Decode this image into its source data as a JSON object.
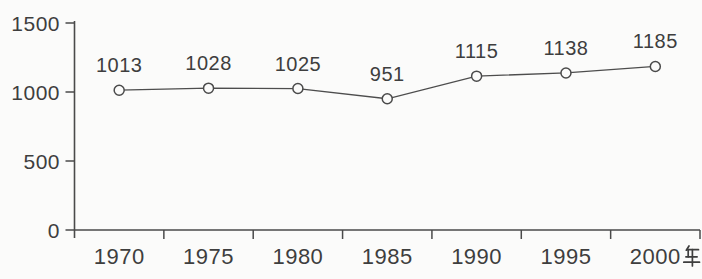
{
  "chart_data": {
    "type": "line",
    "title": "",
    "xlabel": "",
    "ylabel": "",
    "categories": [
      "1970",
      "1975",
      "1980",
      "1985",
      "1990",
      "1995",
      "2000"
    ],
    "values": [
      1013,
      1028,
      1025,
      951,
      1115,
      1138,
      1185
    ],
    "point_labels": [
      "1013",
      "1028",
      "1025",
      "951",
      "1115",
      "1138",
      "1185"
    ],
    "x_axis_unit": "年",
    "ylim": [
      0,
      1500
    ],
    "yticks": [
      0,
      500,
      1000,
      1500
    ],
    "ytick_labels": [
      "0",
      "500",
      "1000",
      "1500"
    ],
    "grid": false,
    "legend": null,
    "marker_style": "open-circle",
    "colors": {
      "line": "#4d4d4d",
      "marker_stroke": "#4a4a4a",
      "text": "#3e3e3e",
      "background": "#fbfbfa"
    }
  }
}
